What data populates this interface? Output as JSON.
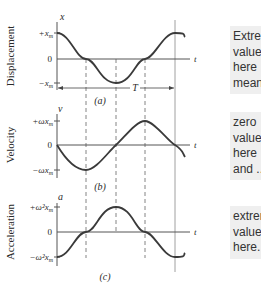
{
  "panels": [
    {
      "id": "a",
      "caption": "(a)",
      "axis_label": "Displacement",
      "var": "x",
      "top_tick": "+x",
      "top_tick_sub": "m",
      "zero_tick": "0",
      "bottom_tick": "−x",
      "bottom_tick_sub": "m",
      "t_label": "t",
      "period_label": "T",
      "note_lines": [
        "Extreme",
        "values",
        "here",
        "mean ..."
      ]
    },
    {
      "id": "b",
      "caption": "(b)",
      "axis_label": "Velocity",
      "var": "v",
      "top_tick": "+ωx",
      "top_tick_sub": "m",
      "zero_tick": "0",
      "bottom_tick": "−ωx",
      "bottom_tick_sub": "m",
      "t_label": "t",
      "note_lines": [
        "zero",
        "values",
        "here",
        "and ..."
      ]
    },
    {
      "id": "c",
      "caption": "(c)",
      "axis_label": "Acceleration",
      "var": "a",
      "top_tick": "+ω²x",
      "top_tick_sub": "m",
      "zero_tick": "0",
      "bottom_tick": "−ω²x",
      "bottom_tick_sub": "m",
      "t_label": "t",
      "note_lines": [
        "extreme",
        "values",
        "here."
      ]
    }
  ],
  "colors": {
    "curve": "#3a3a3a",
    "axis": "#555555",
    "note_bg": "#efefef"
  }
}
